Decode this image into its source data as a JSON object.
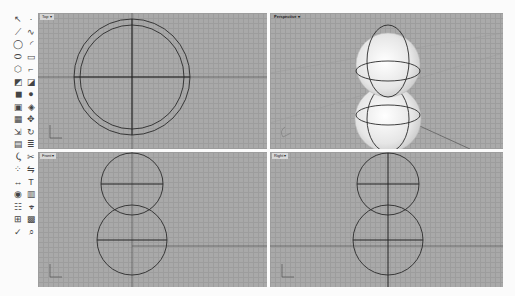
{
  "toolbar": {
    "tools": [
      {
        "name": "select-icon",
        "glyph": "↖"
      },
      {
        "name": "point-icon",
        "glyph": "·"
      },
      {
        "name": "polyline-icon",
        "glyph": "⟋"
      },
      {
        "name": "curve-icon",
        "glyph": "∿"
      },
      {
        "name": "circle-icon",
        "glyph": "◯"
      },
      {
        "name": "arc-icon",
        "glyph": "◜"
      },
      {
        "name": "ellipse-icon",
        "glyph": "⬭"
      },
      {
        "name": "rectangle-icon",
        "glyph": "▭"
      },
      {
        "name": "polygon-icon",
        "glyph": "⬡"
      },
      {
        "name": "fillet-icon",
        "glyph": "⌐"
      },
      {
        "name": "surface-icon",
        "glyph": "◩"
      },
      {
        "name": "loft-icon",
        "glyph": "◪"
      },
      {
        "name": "box-icon",
        "glyph": "◼"
      },
      {
        "name": "sphere-icon",
        "glyph": "●"
      },
      {
        "name": "extrude-icon",
        "glyph": "▣"
      },
      {
        "name": "boolean-icon",
        "glyph": "◈"
      },
      {
        "name": "mesh-icon",
        "glyph": "▦"
      },
      {
        "name": "transform-icon",
        "glyph": "✥"
      },
      {
        "name": "move-icon",
        "glyph": "⇲"
      },
      {
        "name": "rotate-icon",
        "glyph": "↻"
      },
      {
        "name": "group-icon",
        "glyph": "▤"
      },
      {
        "name": "layer-icon",
        "glyph": "≣"
      },
      {
        "name": "split-icon",
        "glyph": "⤹"
      },
      {
        "name": "trim-icon",
        "glyph": "✂"
      },
      {
        "name": "array-icon",
        "glyph": "⁘"
      },
      {
        "name": "mirror-icon",
        "glyph": "⇋"
      },
      {
        "name": "dimension-icon",
        "glyph": "↔"
      },
      {
        "name": "text-icon",
        "glyph": "T"
      },
      {
        "name": "render-icon",
        "glyph": "◉"
      },
      {
        "name": "material-icon",
        "glyph": "▥"
      },
      {
        "name": "properties-icon",
        "glyph": "☷"
      },
      {
        "name": "analyze-icon",
        "glyph": "⌖"
      },
      {
        "name": "snap-icon",
        "glyph": "⊞"
      },
      {
        "name": "grid-icon",
        "glyph": "▩"
      },
      {
        "name": "check-icon",
        "glyph": "✓"
      },
      {
        "name": "zoom-icon",
        "glyph": "⌕"
      }
    ]
  },
  "viewports": {
    "top": {
      "label": "Top ▾"
    },
    "perspective": {
      "label": "Perspective ▾"
    },
    "front": {
      "label": "Front ▾"
    },
    "right": {
      "label": "Right ▾"
    }
  },
  "colors": {
    "viewport_bg": "#a9a9a9",
    "grid_line": "#9d9d9d",
    "curve": "#2a2a2a",
    "background": "#fbfbfb"
  }
}
